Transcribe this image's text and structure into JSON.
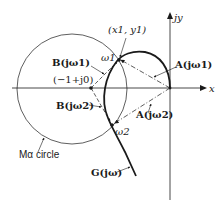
{
  "diagram": {
    "type": "polar-plot-m-circle",
    "axes": {
      "x_label": "x",
      "y_label": "jy"
    },
    "labels": {
      "point_x1y1": "(x1, y1)",
      "omega1": "ω1",
      "omega2": "ω2",
      "A_jw1": "A(jω1)",
      "A_jw2": "A(jω2)",
      "B_jw1": "B(jω1)",
      "B_jw2": "B(jω2)",
      "minus1": "(−1+j0)",
      "m_circle": "Mα circle",
      "G_jw": "G(jω)"
    },
    "colors": {
      "stroke": "#1a1a1a",
      "background": "#ffffff"
    }
  }
}
